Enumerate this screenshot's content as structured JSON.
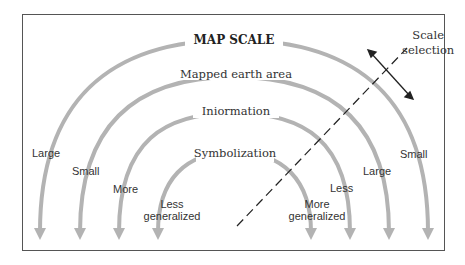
{
  "diagram": {
    "title": "MAP SCALE",
    "arcs": [
      {
        "label": "MAP SCALE",
        "left": "Large",
        "right": "Small"
      },
      {
        "label": "Mapped earth area",
        "left": "Small",
        "right": "Large"
      },
      {
        "label": "Iniormation",
        "left": "More",
        "right": "Less"
      },
      {
        "label": "Symbolization",
        "left": "Less generalized",
        "right": "More generalized"
      }
    ],
    "scale_selection": {
      "line1": "Scale",
      "line2": "selection"
    },
    "colors": {
      "arc": "#b3b3b3",
      "text": "#333333",
      "frame": "#555555"
    }
  }
}
